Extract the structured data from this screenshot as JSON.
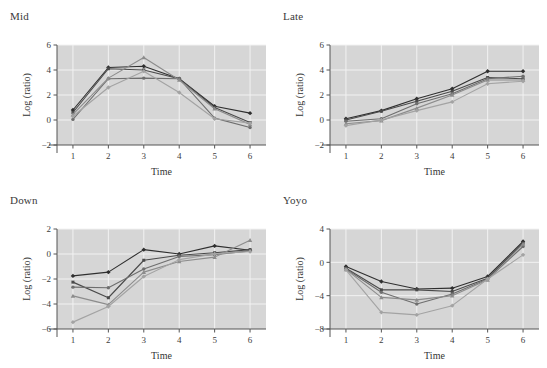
{
  "figure": {
    "background": "#ffffff",
    "panel_background": "#d6d6d6",
    "grid_color": "#f2f2f2",
    "axis_color": "#555555",
    "layout": "2x2 grid of line charts"
  },
  "series_styles": [
    {
      "name": "Series 1",
      "color": "#2f2f2f",
      "marker": "diamond"
    },
    {
      "name": "Series 2",
      "color": "#4a4a4a",
      "marker": "square"
    },
    {
      "name": "Series 3",
      "color": "#6e6e6e",
      "marker": "circle"
    },
    {
      "name": "Series 4",
      "color": "#8c8c8c",
      "marker": "triangle"
    },
    {
      "name": "Series 5",
      "color": "#a3a3a3",
      "marker": "diamond"
    }
  ],
  "chart_data": [
    {
      "type": "line",
      "title": "Mid",
      "xlabel": "Time",
      "ylabel": "Log (ratio)",
      "x": [
        1,
        2,
        3,
        4,
        5,
        6
      ],
      "xlim": [
        0.55,
        6.45
      ],
      "ylim": [
        -2,
        6
      ],
      "yticks": [
        -2,
        0,
        2,
        4,
        6
      ],
      "xticks": [
        1,
        2,
        3,
        4,
        5,
        6
      ],
      "grid": true,
      "legend": "none",
      "series": [
        {
          "name": "Series 1",
          "values": [
            0.8,
            4.2,
            4.3,
            3.3,
            1.1,
            0.55
          ]
        },
        {
          "name": "Series 2",
          "values": [
            0.6,
            4.1,
            4.0,
            3.3,
            1.0,
            -0.2
          ]
        },
        {
          "name": "Series 3",
          "values": [
            0.05,
            3.3,
            3.35,
            3.3,
            0.15,
            -0.6
          ]
        },
        {
          "name": "Series 4",
          "values": [
            0.45,
            3.35,
            5.0,
            3.2,
            0.9,
            -0.35
          ]
        },
        {
          "name": "Series 5",
          "values": [
            0.3,
            2.6,
            3.9,
            2.2,
            0.1,
            -0.25
          ]
        }
      ]
    },
    {
      "type": "line",
      "title": "Late",
      "xlabel": "Time",
      "ylabel": "Log (ratio)",
      "x": [
        1,
        2,
        3,
        4,
        5,
        6
      ],
      "xlim": [
        0.55,
        6.45
      ],
      "ylim": [
        -2,
        6
      ],
      "yticks": [
        -2,
        0,
        2,
        4,
        6
      ],
      "xticks": [
        1,
        2,
        3,
        4,
        5,
        6
      ],
      "grid": true,
      "legend": "none",
      "series": [
        {
          "name": "Series 1",
          "values": [
            0.1,
            0.75,
            1.7,
            2.5,
            3.9,
            3.9
          ]
        },
        {
          "name": "Series 2",
          "values": [
            0.0,
            0.7,
            1.5,
            2.3,
            3.4,
            3.3
          ]
        },
        {
          "name": "Series 3",
          "values": [
            -0.1,
            0.1,
            1.3,
            2.1,
            3.3,
            3.5
          ]
        },
        {
          "name": "Series 4",
          "values": [
            -0.3,
            -0.05,
            0.95,
            2.0,
            3.2,
            3.2
          ]
        },
        {
          "name": "Series 5",
          "values": [
            -0.45,
            0.0,
            0.75,
            1.45,
            2.9,
            3.1
          ]
        }
      ]
    },
    {
      "type": "line",
      "title": "Down",
      "xlabel": "Time",
      "ylabel": "Log (ratio)",
      "x": [
        1,
        2,
        3,
        4,
        5,
        6
      ],
      "xlim": [
        0.55,
        6.45
      ],
      "ylim": [
        -6,
        2
      ],
      "yticks": [
        -6,
        -4,
        -2,
        0,
        2
      ],
      "xticks": [
        1,
        2,
        3,
        4,
        5,
        6
      ],
      "grid": true,
      "legend": "none",
      "series": [
        {
          "name": "Series 1",
          "values": [
            -1.75,
            -1.45,
            0.35,
            0.0,
            0.65,
            0.3
          ]
        },
        {
          "name": "Series 2",
          "values": [
            -2.25,
            -3.5,
            -0.5,
            -0.1,
            0.1,
            0.35
          ]
        },
        {
          "name": "Series 3",
          "values": [
            -2.65,
            -2.7,
            -1.2,
            -0.2,
            -0.05,
            0.25
          ]
        },
        {
          "name": "Series 4",
          "values": [
            -3.35,
            -4.05,
            -1.45,
            -0.6,
            -0.25,
            1.1
          ]
        },
        {
          "name": "Series 5",
          "values": [
            -5.45,
            -4.2,
            -1.8,
            -0.45,
            0.0,
            0.2
          ]
        }
      ]
    },
    {
      "type": "line",
      "title": "Yoyo",
      "xlabel": "Time",
      "ylabel": "Log (ratio)",
      "x": [
        1,
        2,
        3,
        4,
        5,
        6
      ],
      "xlim": [
        0.55,
        6.45
      ],
      "ylim": [
        -8,
        4
      ],
      "yticks": [
        -8,
        -4,
        0,
        4
      ],
      "xticks": [
        1,
        2,
        3,
        4,
        5,
        6
      ],
      "grid": true,
      "legend": "none",
      "series": [
        {
          "name": "Series 1",
          "values": [
            -0.5,
            -2.3,
            -3.2,
            -3.1,
            -1.7,
            2.5
          ]
        },
        {
          "name": "Series 2",
          "values": [
            -0.7,
            -3.3,
            -3.3,
            -3.5,
            -1.9,
            2.3
          ]
        },
        {
          "name": "Series 3",
          "values": [
            -0.8,
            -3.6,
            -5.0,
            -3.8,
            -2.0,
            1.9
          ]
        },
        {
          "name": "Series 4",
          "values": [
            -0.85,
            -4.2,
            -4.5,
            -4.0,
            -2.1,
            2.2
          ]
        },
        {
          "name": "Series 5",
          "values": [
            -0.9,
            -6.0,
            -6.3,
            -5.2,
            -2.0,
            0.9
          ]
        }
      ]
    }
  ]
}
